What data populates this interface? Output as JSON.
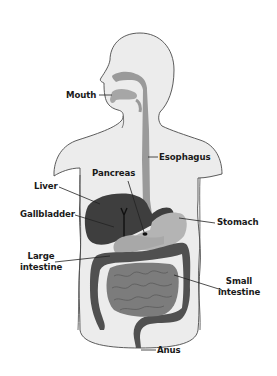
{
  "colors": {
    "body_fill": "#ececec",
    "body_outline": "#4a4a4a",
    "tract": "#9a9a9a",
    "liver": "#3e3e3e",
    "stomach": "#b4b4b4",
    "large_intestine": "#505050",
    "small_intestine": "#7c7c7c",
    "pancreas": "#a8a8a8",
    "leader_line": "#222222",
    "label_text": "#1a1a1a"
  },
  "labels": {
    "mouth": "Mouth",
    "esophagus": "Esophagus",
    "pancreas": "Pancreas",
    "liver": "Liver",
    "gallbladder": "Gallbladder",
    "stomach": "Stomach",
    "large_intestine_1": "Large",
    "large_intestine_2": "intestine",
    "small_intestine_1": "Small",
    "small_intestine_2": "intestine",
    "anus": "Anus"
  }
}
